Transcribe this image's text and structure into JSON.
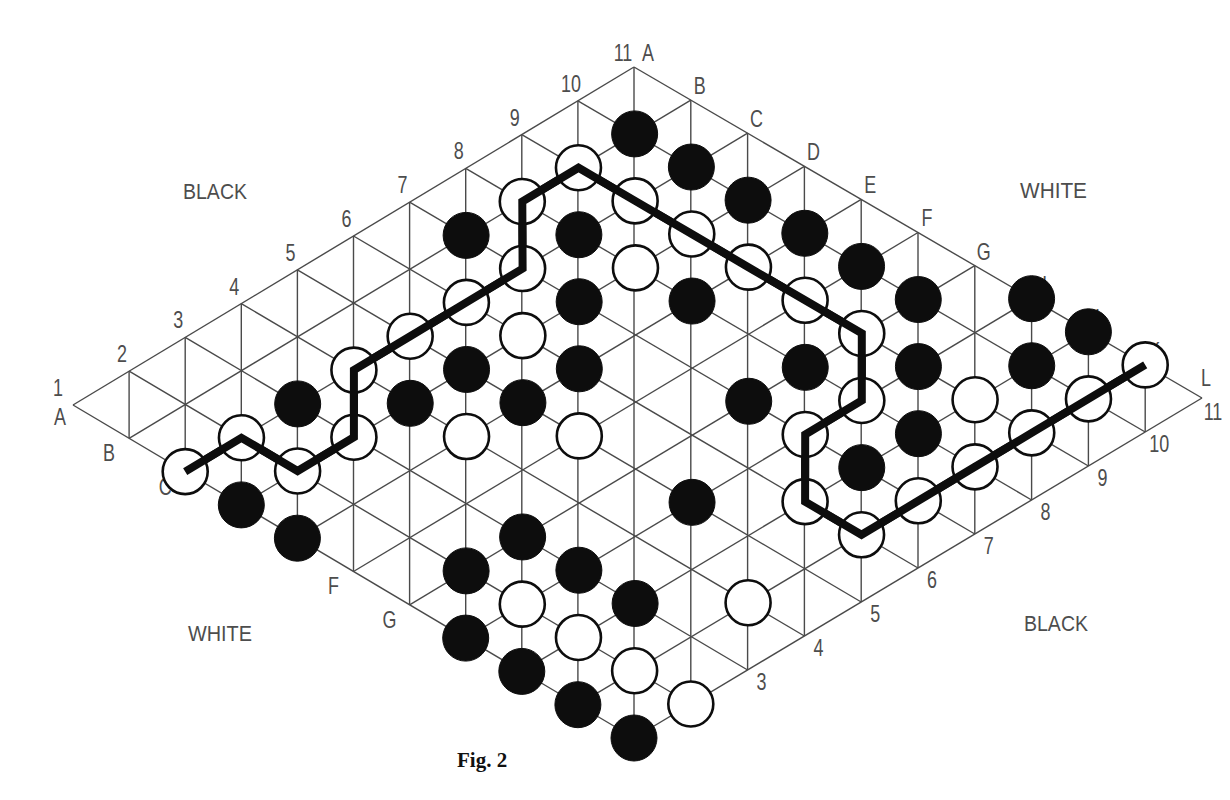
{
  "figure": {
    "caption": "Fig. 2",
    "game": "Hex",
    "board_size": 11
  },
  "sides": {
    "top_left": "BLACK",
    "top_right": "WHITE",
    "bottom_left": "WHITE",
    "bottom_right": "BLACK"
  },
  "coordinates": {
    "numbers": [
      "1",
      "2",
      "3",
      "4",
      "5",
      "6",
      "7",
      "8",
      "9",
      "10",
      "11"
    ],
    "letters": [
      "A",
      "B",
      "C",
      "D",
      "E",
      "F",
      "G",
      "H",
      "I",
      "K",
      "L"
    ],
    "top_left_edge_labels": [
      "1",
      "2",
      "3",
      "4",
      "5",
      "6",
      "7",
      "8",
      "9",
      "10",
      "11"
    ],
    "top_right_edge_labels": [
      "A",
      "B",
      "C",
      "D",
      "E",
      "F",
      "G",
      "H",
      "I",
      "K",
      "L"
    ],
    "bottom_left_edge_labels": [
      {
        "letter": "A",
        "index": 0
      },
      {
        "letter": "B",
        "index": 1
      },
      {
        "letter": "C",
        "index": 2
      },
      {
        "letter": "F",
        "index": 5
      },
      {
        "letter": "G",
        "index": 6
      }
    ],
    "bottom_right_edge_labels": [
      "3",
      "4",
      "5",
      "6",
      "7",
      "8",
      "9",
      "10",
      "11"
    ]
  },
  "stones": {
    "black": [
      "10B",
      "10C",
      "10D",
      "10E",
      "10F",
      "10G",
      "11H",
      "11I",
      "7B",
      "8C",
      "7D",
      "8E",
      "5D",
      "6E",
      "3C",
      "4D",
      "5E",
      "7G",
      "8G",
      "9H",
      "10I",
      "8I",
      "7I",
      "1D",
      "1E",
      "5H",
      "3G",
      "2G",
      "3H",
      "3I",
      "1H",
      "1I",
      "1K",
      "1L"
    ],
    "white": [
      "9B",
      "8B",
      "9C",
      "9D",
      "7C",
      "8D",
      "9E",
      "6C",
      "9F",
      "5C",
      "6D",
      "9G",
      "4C",
      "8H",
      "2C",
      "3D",
      "4E",
      "5F",
      "7H",
      "1C",
      "2D",
      "9I",
      "10K",
      "11K",
      "9K",
      "8K",
      "7K",
      "6I",
      "6K",
      "2H",
      "4K",
      "2I",
      "2K",
      "2L"
    ]
  },
  "winning_path": {
    "color": "white",
    "cells": [
      "1C",
      "2C",
      "2D",
      "3D",
      "4C",
      "5C",
      "6C",
      "7C",
      "8B",
      "9B",
      "9C",
      "9D",
      "9E",
      "9F",
      "9G",
      "8H",
      "7H",
      "6I",
      "6K",
      "7K",
      "8K",
      "9K",
      "10K",
      "11K"
    ]
  },
  "colors": {
    "grid": "#4a4a4a",
    "stone_black": "#0d0d0d",
    "stone_white": "#ffffff",
    "label": "#4d4d4d"
  }
}
